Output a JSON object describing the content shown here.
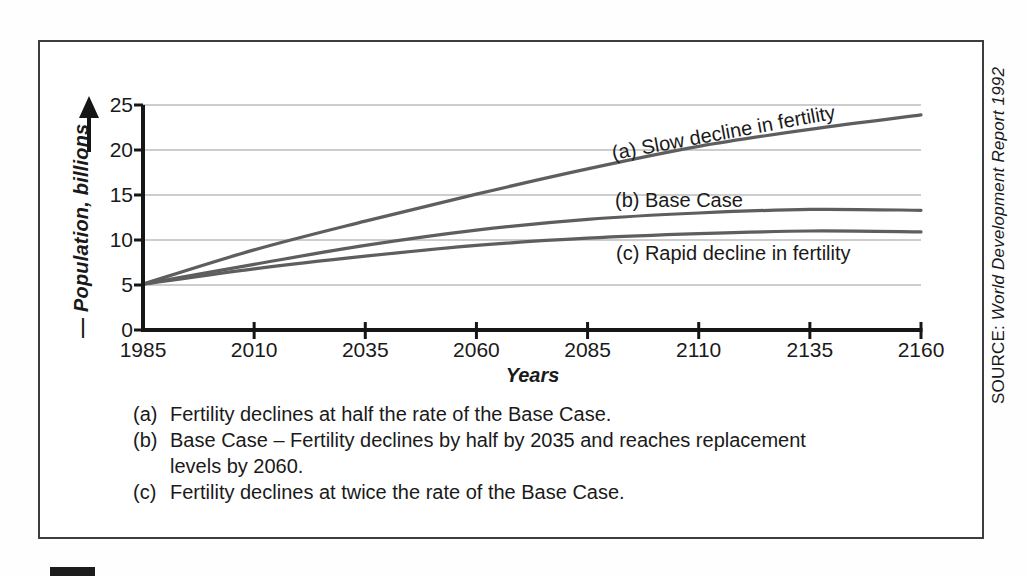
{
  "source": {
    "label": "SOURCE:",
    "title": "World Development Report 1992"
  },
  "footnotes": [
    {
      "marker": "(a)",
      "text": "Fertility declines at half the rate of the Base Case."
    },
    {
      "marker": "(b)",
      "text": "Base Case – Fertility declines by half by 2035 and reaches replacement levels by 2060."
    },
    {
      "marker": "(c)",
      "text": "Fertility declines at twice the rate of the Base Case."
    }
  ],
  "icons": {
    "y_axis_arrow": "up-arrow-icon"
  },
  "colors": {
    "curve": "#5e5e5e",
    "gridline": "#9b9b9b",
    "axis": "#161616",
    "text": "#1a1a1a"
  },
  "chart_data": {
    "type": "line",
    "title": "",
    "xlabel": "Years",
    "ylabel": "— Population, billions",
    "xlim": [
      1985,
      2160
    ],
    "ylim": [
      0,
      25
    ],
    "x_ticks": [
      1985,
      2010,
      2035,
      2060,
      2085,
      2110,
      2135,
      2160
    ],
    "y_ticks": [
      0,
      5,
      10,
      15,
      20,
      25
    ],
    "grid": "horizontal",
    "legend_position": "labels-on-curves",
    "x": [
      1985,
      2010,
      2035,
      2060,
      2085,
      2110,
      2135,
      2160
    ],
    "series": [
      {
        "name": "(a) Slow decline in fertility",
        "values": [
          5.1,
          8.9,
          12.1,
          15.1,
          17.9,
          20.4,
          22.3,
          23.9
        ]
      },
      {
        "name": "(b) Base Case",
        "values": [
          5.1,
          7.3,
          9.4,
          11.1,
          12.3,
          13.0,
          13.4,
          13.3
        ]
      },
      {
        "name": "(c) Rapid decline in fertility",
        "values": [
          5.1,
          6.8,
          8.2,
          9.4,
          10.2,
          10.7,
          11.0,
          10.9
        ]
      }
    ]
  }
}
